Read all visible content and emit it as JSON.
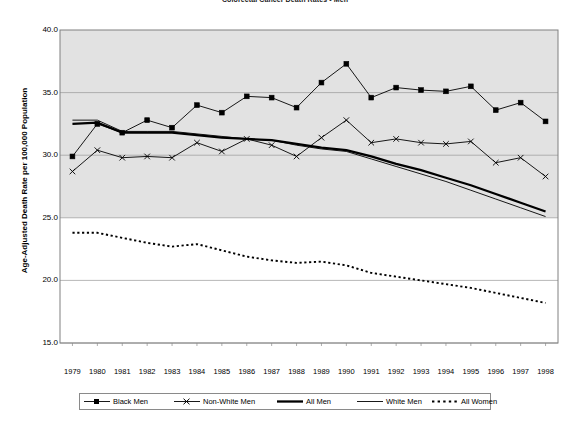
{
  "chart_data": {
    "type": "line",
    "title": "Colorectal Cancer Death Rates - Men",
    "xlabel": "",
    "ylabel": "Age-Adjusted Death Rate per 100,000 Population",
    "ylim": [
      15.0,
      40.0
    ],
    "ytick_labels": [
      "40.0",
      "35.0",
      "30.0",
      "25.0",
      "20.0",
      "15.0"
    ],
    "ytick_values": [
      40.0,
      35.0,
      30.0,
      25.0,
      20.0,
      15.0
    ],
    "grid": true,
    "legend_position": "bottom",
    "categories": [
      "1979",
      "1980",
      "1981",
      "1982",
      "1983",
      "1984",
      "1985",
      "1986",
      "1987",
      "1988",
      "1989",
      "1990",
      "1991",
      "1992",
      "1993",
      "1994",
      "1995",
      "1996",
      "1997",
      "1998"
    ],
    "x": [
      1979,
      1980,
      1981,
      1982,
      1983,
      1984,
      1985,
      1986,
      1987,
      1988,
      1989,
      1990,
      1991,
      1992,
      1993,
      1994,
      1995,
      1996,
      1997,
      1998
    ],
    "series": [
      {
        "name": "Black Men",
        "marker": "square",
        "linestyle": "solid-thin",
        "color": "#000000",
        "values": [
          29.9,
          32.5,
          31.8,
          32.8,
          32.2,
          34.0,
          33.4,
          34.7,
          34.6,
          33.8,
          35.8,
          37.3,
          34.6,
          35.4,
          35.2,
          35.1,
          35.5,
          33.6,
          34.2,
          32.7
        ]
      },
      {
        "name": "Non-White Men",
        "marker": "x",
        "linestyle": "solid-thin",
        "color": "#000000",
        "values": [
          28.7,
          30.4,
          29.8,
          29.9,
          29.8,
          31.0,
          30.3,
          31.3,
          30.8,
          29.9,
          31.4,
          32.8,
          31.0,
          31.3,
          31.0,
          30.9,
          31.1,
          29.4,
          29.8,
          28.3
        ]
      },
      {
        "name": "All Men",
        "marker": "none",
        "linestyle": "solid-thick",
        "color": "#000000",
        "values": [
          32.5,
          32.6,
          31.8,
          31.8,
          31.8,
          31.6,
          31.4,
          31.3,
          31.2,
          30.9,
          30.6,
          30.4,
          29.9,
          29.3,
          28.8,
          28.2,
          27.6,
          26.9,
          26.2,
          25.5
        ]
      },
      {
        "name": "White Men",
        "marker": "none",
        "linestyle": "solid-thin",
        "color": "#000000",
        "values": [
          32.8,
          32.8,
          31.9,
          31.9,
          31.9,
          31.7,
          31.5,
          31.3,
          31.2,
          30.8,
          30.5,
          30.3,
          29.7,
          29.1,
          28.5,
          27.9,
          27.2,
          26.5,
          25.8,
          25.1
        ]
      },
      {
        "name": "All Women",
        "marker": "none",
        "linestyle": "dotted",
        "color": "#000000",
        "values": [
          23.8,
          23.8,
          23.4,
          23.0,
          22.7,
          22.9,
          22.4,
          21.9,
          21.6,
          21.4,
          21.5,
          21.2,
          20.6,
          20.3,
          20.0,
          19.7,
          19.4,
          19.0,
          18.6,
          18.2
        ]
      }
    ],
    "plot_background_upper": "#e2e2e2",
    "plot_background_lower": "#ffffff",
    "shaded_band_top": 40.0,
    "shaded_band_bottom": 25.0
  },
  "legend": {
    "items": [
      {
        "label": "Black Men",
        "style": "square-marker-line"
      },
      {
        "label": "Non-White Men",
        "style": "x-marker-line"
      },
      {
        "label": "All Men",
        "style": "thick-line"
      },
      {
        "label": "White Men",
        "style": "thin-line"
      },
      {
        "label": "All Women",
        "style": "dotted-line"
      }
    ]
  }
}
